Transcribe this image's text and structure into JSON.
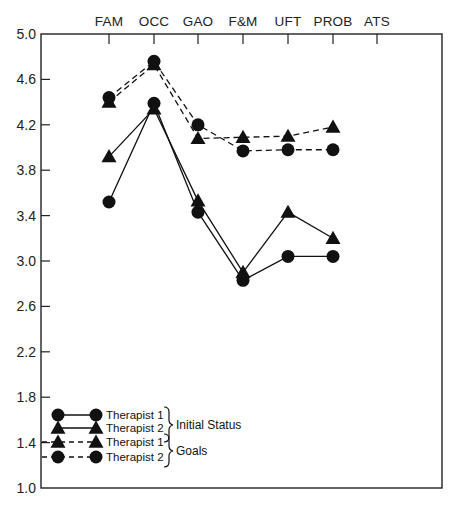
{
  "chart_data": {
    "type": "line",
    "title": "",
    "xlabel": "",
    "ylabel": "",
    "ylim": [
      1.0,
      5.0
    ],
    "yticks": [
      "5.0",
      "4.6",
      "4.2",
      "3.8",
      "3.4",
      "3.0",
      "2.6",
      "2.2",
      "1.8",
      "1.4",
      "1.0"
    ],
    "categories": [
      "FAM",
      "OCC",
      "GAO",
      "F&M",
      "UFT",
      "PROB",
      "ATS"
    ],
    "x_axis_position": "top",
    "grid": false,
    "legend_position": "lower left",
    "series": [
      {
        "name": "Therapist 1",
        "group": "Initial Status",
        "marker": "circle",
        "line": "solid",
        "values": [
          3.52,
          4.39,
          3.43,
          2.83,
          3.04,
          3.04,
          null
        ]
      },
      {
        "name": "Therapist 2",
        "group": "Initial Status",
        "marker": "triangle",
        "line": "solid",
        "values": [
          3.92,
          4.34,
          3.53,
          2.9,
          3.43,
          3.2,
          null
        ]
      },
      {
        "name": "Therapist 1",
        "group": "Goals",
        "marker": "triangle",
        "line": "dashed",
        "values": [
          4.4,
          4.73,
          4.08,
          4.09,
          4.1,
          4.18,
          null
        ]
      },
      {
        "name": "Therapist 2",
        "group": "Goals",
        "marker": "circle",
        "line": "dashed",
        "values": [
          4.44,
          4.76,
          4.2,
          3.97,
          3.98,
          3.98,
          null
        ]
      }
    ],
    "legend": {
      "entries": [
        {
          "label": "Therapist 1",
          "marker": "circle",
          "line": "solid"
        },
        {
          "label": "Therapist 2",
          "marker": "triangle",
          "line": "solid"
        },
        {
          "label": "Therapist 1",
          "marker": "triangle",
          "line": "dashed"
        },
        {
          "label": "Therapist 2",
          "marker": "circle",
          "line": "dashed"
        }
      ],
      "groups": [
        "Initial Status",
        "Goals"
      ]
    }
  },
  "colors": {
    "ink": "#111111",
    "background": "#ffffff"
  }
}
